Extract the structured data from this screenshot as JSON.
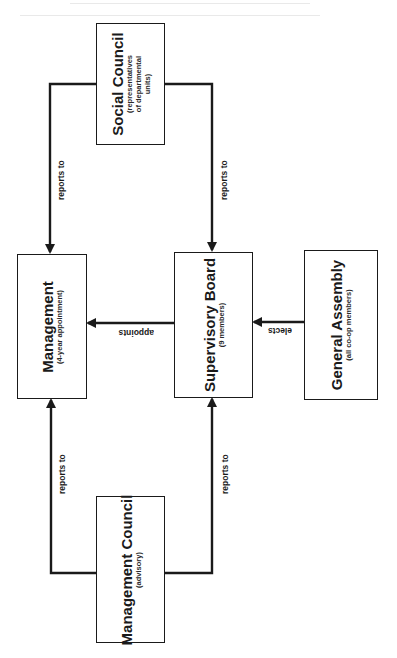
{
  "diagram": {
    "orientation": "rotated 90deg counter-clockwise",
    "colors": {
      "ink": "#1a1a1a",
      "paper": "#ffffff"
    },
    "nodes": {
      "social_council": {
        "title": "Social Council",
        "subtitle_lines": [
          "(representatives",
          "of departmental",
          "units)"
        ]
      },
      "management": {
        "title": "Management",
        "subtitle": "(4-year appointment)"
      },
      "supervisory_board": {
        "title": "Supervisory Board",
        "subtitle": "(9 members)"
      },
      "general_assembly": {
        "title": "General Assembly",
        "subtitle": "(all co-op members)"
      },
      "management_council": {
        "title": "Management Council",
        "subtitle": "(advisory)"
      }
    },
    "edges": [
      {
        "from": "social_council",
        "to": "management",
        "label": "reports to"
      },
      {
        "from": "social_council",
        "to": "supervisory_board",
        "label": "reports to"
      },
      {
        "from": "supervisory_board",
        "to": "management",
        "label": "appoints"
      },
      {
        "from": "general_assembly",
        "to": "supervisory_board",
        "label": "elects"
      },
      {
        "from": "management_council",
        "to": "management",
        "label": "reports to"
      },
      {
        "from": "management_council",
        "to": "supervisory_board",
        "label": "reports to"
      }
    ]
  }
}
